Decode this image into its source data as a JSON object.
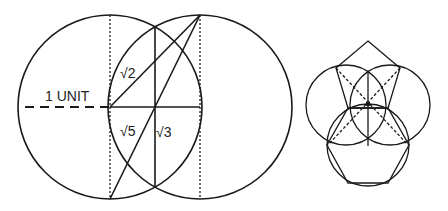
{
  "diagram": {
    "left": {
      "unit_label": "1 UNIT",
      "labels": {
        "sqrt2": "√2",
        "sqrt5": "√5",
        "sqrt3": "√3"
      },
      "circles": [
        {
          "cx": 110,
          "cy": 107,
          "r": 92
        },
        {
          "cx": 200,
          "cy": 107,
          "r": 92
        }
      ]
    },
    "right": {
      "description": "Vesica piscis construction of pentagon and hexagon",
      "circles": [
        {
          "cx": 346,
          "cy": 105,
          "r": 40
        },
        {
          "cx": 390,
          "cy": 105,
          "r": 40
        },
        {
          "cx": 368,
          "cy": 145,
          "r": 41
        }
      ]
    },
    "stroke_color": "#1a1a1a"
  }
}
